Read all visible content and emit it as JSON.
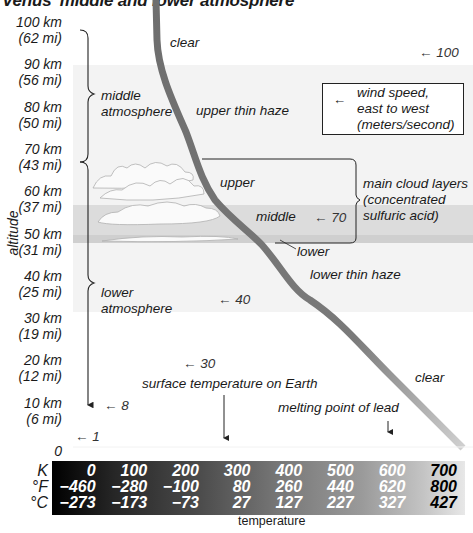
{
  "title": "Venus' middle and lower atmosphere",
  "altitude_axis": {
    "label": "altitude",
    "ticks": [
      {
        "km": "100 km",
        "mi": "(62 mi)"
      },
      {
        "km": "90 km",
        "mi": "(56 mi)"
      },
      {
        "km": "80 km",
        "mi": "(50 mi)"
      },
      {
        "km": "70 km",
        "mi": "(43 mi)"
      },
      {
        "km": "60 km",
        "mi": "(37 mi)"
      },
      {
        "km": "50 km",
        "mi": "(31 mi)"
      },
      {
        "km": "40 km",
        "mi": "(25 mi)"
      },
      {
        "km": "30 km",
        "mi": "(19 mi)"
      },
      {
        "km": "20 km",
        "mi": "(12 mi)"
      },
      {
        "km": "10 km",
        "mi": "(6 mi)"
      },
      {
        "km": "0",
        "mi": ""
      }
    ]
  },
  "regions": {
    "middle": [
      "middle",
      "atmosphere"
    ],
    "lower": [
      "lower",
      "atmosphere"
    ]
  },
  "haze_labels": {
    "clear_top": "clear",
    "upper_haze": "upper thin haze",
    "upper_cloud": "upper",
    "middle_cloud": "middle",
    "lower_cloud": "lower",
    "lower_haze": "lower thin haze",
    "clear_bottom": "clear"
  },
  "cloud_layers": [
    "main cloud layers",
    "(concentrated",
    "sulfuric acid)"
  ],
  "legend": {
    "arrow": "←",
    "lines": [
      "wind speed,",
      "east to west",
      "(meters/second)"
    ]
  },
  "wind_speeds": [
    {
      "altitude_km": 95,
      "value": "100"
    },
    {
      "altitude_km": 52,
      "value": "70"
    },
    {
      "altitude_km": 33,
      "value": "40"
    },
    {
      "altitude_km": 18,
      "value": "30"
    },
    {
      "altitude_km": 7,
      "value": "8"
    },
    {
      "altitude_km": 0,
      "value": "1"
    }
  ],
  "annotations": {
    "earth_surface": "surface temperature on Earth",
    "lead_melting": "melting point of lead"
  },
  "temperature_scale": {
    "units": [
      "K",
      "°F",
      "°C"
    ],
    "columns": [
      {
        "K": "0",
        "F": "−460",
        "C": "−273"
      },
      {
        "K": "100",
        "F": "−280",
        "C": "−173"
      },
      {
        "K": "200",
        "F": "−100",
        "C": "−73"
      },
      {
        "K": "300",
        "F": "80",
        "C": "27"
      },
      {
        "K": "400",
        "F": "260",
        "C": "127"
      },
      {
        "K": "500",
        "F": "440",
        "C": "227"
      },
      {
        "K": "600",
        "F": "620",
        "C": "327"
      },
      {
        "K": "700",
        "F": "800",
        "C": "427"
      }
    ],
    "label": "temperature"
  },
  "temperature_profile": {
    "unit": "K",
    "points": [
      {
        "alt_km": 100,
        "temp_K": 165
      },
      {
        "alt_km": 90,
        "temp_K": 168
      },
      {
        "alt_km": 80,
        "temp_K": 185
      },
      {
        "alt_km": 70,
        "temp_K": 220
      },
      {
        "alt_km": 60,
        "temp_K": 262
      },
      {
        "alt_km": 50,
        "temp_K": 340
      },
      {
        "alt_km": 40,
        "temp_K": 405
      },
      {
        "alt_km": 30,
        "temp_K": 470
      },
      {
        "alt_km": 20,
        "temp_K": 560
      },
      {
        "alt_km": 10,
        "temp_K": 635
      },
      {
        "alt_km": 0,
        "temp_K": 735
      }
    ]
  },
  "colors": {
    "haze_band": "#f3f3f3",
    "cloud_band": "#dcdcdc",
    "curve_dark": "#6a6a6a",
    "curve_light": "#c8c8c8"
  }
}
